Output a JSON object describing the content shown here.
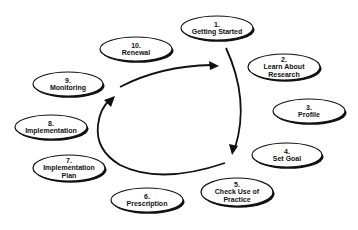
{
  "diagram": {
    "type": "cycle",
    "nodes": [
      {
        "number": "1.",
        "lines": [
          "Getting Started"
        ],
        "cx": 217,
        "cy": 28,
        "rx": 36,
        "ry": 12
      },
      {
        "number": "2.",
        "lines": [
          "Learn About",
          "Research"
        ],
        "cx": 284,
        "cy": 67,
        "rx": 36,
        "ry": 13
      },
      {
        "number": "3.",
        "lines": [
          "Profile"
        ],
        "cx": 309,
        "cy": 111,
        "rx": 36,
        "ry": 12
      },
      {
        "number": "4.",
        "lines": [
          "Set Goal"
        ],
        "cx": 287,
        "cy": 155,
        "rx": 35,
        "ry": 12
      },
      {
        "number": "5.",
        "lines": [
          "Check Use of",
          "Practice"
        ],
        "cx": 237,
        "cy": 192,
        "rx": 36,
        "ry": 14
      },
      {
        "number": "6.",
        "lines": [
          "Prescription"
        ],
        "cx": 147,
        "cy": 200,
        "rx": 36,
        "ry": 12
      },
      {
        "number": "7.",
        "lines": [
          "Implementation",
          "Plan"
        ],
        "cx": 69,
        "cy": 168,
        "rx": 36,
        "ry": 13
      },
      {
        "number": "8.",
        "lines": [
          "Implementation"
        ],
        "cx": 51,
        "cy": 127,
        "rx": 36,
        "ry": 12
      },
      {
        "number": "9.",
        "lines": [
          "Monitoring"
        ],
        "cx": 68,
        "cy": 84,
        "rx": 35,
        "ry": 12
      },
      {
        "number": "10.",
        "lines": [
          "Renewal"
        ],
        "cx": 136,
        "cy": 49,
        "rx": 36,
        "ry": 12
      }
    ],
    "arrows": [
      {
        "from": "10. Renewal",
        "to": "1. Getting Started",
        "direction": "clockwise-top"
      },
      {
        "from": "1. Getting Started",
        "to": "5. Check Use of Practice",
        "direction": "clockwise-right"
      },
      {
        "from": "5. Check Use of Practice",
        "to": "8. Implementation",
        "direction": "clockwise-left"
      }
    ]
  }
}
